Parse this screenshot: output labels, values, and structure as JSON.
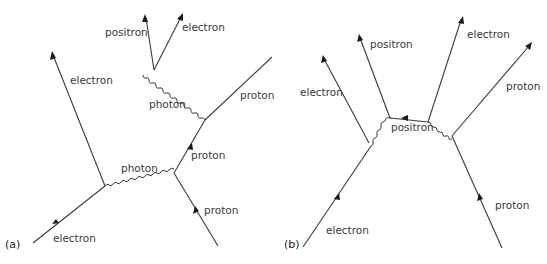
{
  "figure": {
    "panels": [
      {
        "id": "a",
        "panel_label": "(a)",
        "particles": [
          {
            "label": "electron",
            "type": "fermion",
            "role": "incoming electron"
          },
          {
            "label": "electron",
            "type": "fermion",
            "role": "outgoing electron"
          },
          {
            "label": "photon",
            "type": "photon",
            "role": "exchanged photon"
          },
          {
            "label": "proton",
            "type": "fermion",
            "role": "incoming proton"
          },
          {
            "label": "proton",
            "type": "fermion",
            "role": "intermediate proton"
          },
          {
            "label": "proton",
            "type": "fermion",
            "role": "outgoing proton"
          },
          {
            "label": "photon",
            "type": "photon",
            "role": "emitted photon"
          },
          {
            "label": "positron",
            "type": "fermion",
            "role": "pair positron"
          },
          {
            "label": "electron",
            "type": "fermion",
            "role": "pair electron"
          }
        ]
      },
      {
        "id": "b",
        "panel_label": "(b)",
        "particles": [
          {
            "label": "electron",
            "type": "fermion",
            "role": "incoming electron"
          },
          {
            "label": "electron",
            "type": "fermion",
            "role": "outgoing electron"
          },
          {
            "label": "positron",
            "type": "fermion",
            "role": "outgoing positron"
          },
          {
            "label": "positron",
            "type": "fermion",
            "role": "internal positron"
          },
          {
            "label": "electron",
            "type": "fermion",
            "role": "pair electron"
          },
          {
            "label": "proton",
            "type": "fermion",
            "role": "outgoing proton"
          },
          {
            "label": "proton",
            "type": "fermion",
            "role": "incoming proton"
          }
        ]
      }
    ]
  }
}
